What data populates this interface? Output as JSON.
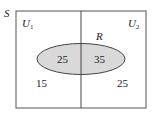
{
  "diagram": {
    "type": "venn",
    "sample_space_label": "S",
    "regions": {
      "left": {
        "label": "U",
        "subscript": "1"
      },
      "right": {
        "label": "U",
        "subscript": "2"
      }
    },
    "ellipse_label": "R",
    "values": {
      "left_inside_R": "25",
      "right_inside_R": "35",
      "left_outside_R": "15",
      "right_outside_R": "25"
    },
    "colors": {
      "ellipse_fill": "#d9d9d9",
      "stroke": "#333333",
      "background": "#ffffff"
    }
  }
}
